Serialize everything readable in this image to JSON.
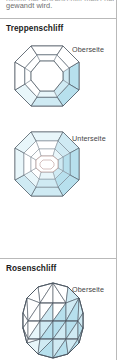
{
  "document": {
    "intro": {
      "line_clipped": "nimmt der Rosenschliff meist der",
      "line_visible": "gewandt wird."
    },
    "sections": [
      {
        "id": "treppenschliff",
        "title": "Treppenschliff",
        "figures": [
          {
            "id": "treppenschliff-oberseite",
            "label": "Oberseite",
            "view": "top",
            "shape": "octagon-step-cut"
          },
          {
            "id": "treppenschliff-unterseite",
            "label": "Unterseite",
            "view": "bottom",
            "shape": "octagon-step-cut"
          }
        ]
      },
      {
        "id": "rosenschliff",
        "title": "Rosenschliff",
        "figures": [
          {
            "id": "rosenschliff-oberseite",
            "label": "Oberseite",
            "view": "top",
            "shape": "rose-cut-triangulated-dome"
          }
        ]
      }
    ],
    "colors": {
      "facet_fill_light": "#e8f6fa",
      "facet_fill_mid": "#cfeaf3",
      "facet_fill_deep": "#b7e0ed",
      "facet_fill_white": "#ffffff",
      "outline": "#4a5560",
      "outline_soft": "#7e8a94",
      "culet_outline": "#a8837e",
      "rule": "#b9b9b9",
      "page_bg": "#ffffff",
      "title_text": "#1b1b1b",
      "label_text": "#444444",
      "body_text": "#6d6d6d"
    }
  }
}
